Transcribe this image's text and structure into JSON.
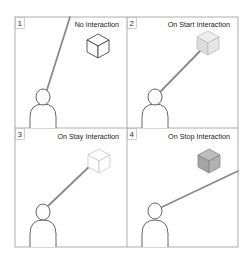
{
  "panels": [
    {
      "number": "1",
      "label": "No interaction",
      "cube_state": "outline",
      "cube_fill": "#ffffff",
      "cube_stroke": "#333333",
      "ray_hits_cube": false
    },
    {
      "number": "2",
      "label": "On Start Interaction",
      "cube_state": "highlighted-light",
      "cube_fill": "#e4e4e4",
      "cube_stroke": "#bbbbbb",
      "ray_hits_cube": true
    },
    {
      "number": "3",
      "label": "On Stay Interaction",
      "cube_state": "faded",
      "cube_fill": "#ffffff",
      "cube_stroke": "#c8c8c8",
      "ray_hits_cube": true
    },
    {
      "number": "4",
      "label": "On Stop Interaction",
      "cube_state": "filled-gray",
      "cube_fill": "#a8a8a8",
      "cube_stroke": "#888888",
      "ray_hits_cube": false
    }
  ],
  "colors": {
    "frame": "#9a9a9a",
    "ray": "#8a8a8a",
    "person_outline": "#555555"
  }
}
